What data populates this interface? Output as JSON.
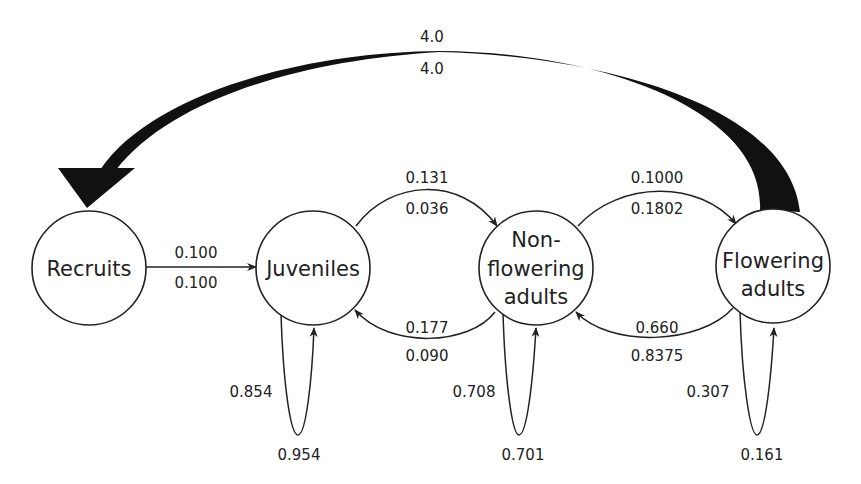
{
  "diagram": {
    "type": "life-cycle-transition-graph",
    "nodes": {
      "recruits": {
        "lines": [
          "Recruits"
        ]
      },
      "juveniles": {
        "lines": [
          "Juveniles"
        ]
      },
      "nonflowering": {
        "lines": [
          "Non-",
          "flowering",
          "adults"
        ]
      },
      "flowering": {
        "lines": [
          "Flowering",
          "adults"
        ]
      }
    },
    "edges": {
      "fecundity": {
        "from": "Flowering adults",
        "to": "Recruits",
        "top": "4.0",
        "bottom": "4.0"
      },
      "recruits_to_juveniles": {
        "from": "Recruits",
        "to": "Juveniles",
        "top": "0.100",
        "bottom": "0.100"
      },
      "juveniles_to_nonflowering": {
        "from": "Juveniles",
        "to": "Non-flowering adults",
        "top": "0.131",
        "bottom": "0.036"
      },
      "nonflowering_to_juveniles": {
        "from": "Non-flowering adults",
        "to": "Juveniles",
        "top": "0.177",
        "bottom": "0.090"
      },
      "nonflowering_to_flowering": {
        "from": "Non-flowering adults",
        "to": "Flowering adults",
        "top": "0.1000",
        "bottom": "0.1802"
      },
      "flowering_to_nonflowering": {
        "from": "Flowering adults",
        "to": "Non-flowering adults",
        "top": "0.660",
        "bottom": "0.8375"
      },
      "juveniles_self": {
        "node": "Juveniles",
        "left": "0.854",
        "bottom": "0.954"
      },
      "nonflowering_self": {
        "node": "Non-flowering adults",
        "left": "0.708",
        "bottom": "0.701"
      },
      "flowering_self": {
        "node": "Flowering adults",
        "left": "0.307",
        "bottom": "0.161"
      }
    }
  }
}
